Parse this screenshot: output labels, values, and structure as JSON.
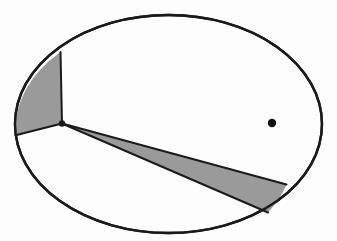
{
  "figure": {
    "type": "geometric-diagram",
    "canvas": {
      "width": 337,
      "height": 241,
      "background": "#fdfdfd"
    },
    "colors": {
      "outline": "#1a1a1a",
      "shade": "#9a9a9a",
      "interior": "#fdfdfd",
      "dot": "#111111"
    },
    "stroke": {
      "outline_width": 2.4,
      "chord_width": 2.0
    },
    "ellipse": {
      "label": "ellipse-boundary",
      "cx": 168.5,
      "cy": 124,
      "rx": 153.5,
      "ry": 109
    },
    "vertex_point": {
      "label": "apex-vertex",
      "x": 62,
      "y": 123.5
    },
    "marked_dot": {
      "label": "focus-dot",
      "x": 272,
      "y": 123,
      "r": 4.2
    },
    "regions": [
      {
        "name": "upper-left-shaded-sector",
        "fill": "#9a9a9a",
        "path": "M 62 123.5 L 60.5 52 A 153.5 109 0 0 0 15.6 135.2 Z"
      },
      {
        "name": "lower-right-shaded-wedge",
        "fill": "#9a9a9a",
        "path": "M 62 123.5 L 286.5 184.5 A 153.5 109 0 0 1 268 212.5 Z"
      }
    ],
    "chords": [
      {
        "name": "upper-radius-chord",
        "x1": 62,
        "y1": 123.5,
        "x2": 60.5,
        "y2": 52
      },
      {
        "name": "left-radius-chord",
        "x1": 62,
        "y1": 123.5,
        "x2": 15.6,
        "y2": 135.2
      },
      {
        "name": "wedge-upper-chord",
        "x1": 62,
        "y1": 123.5,
        "x2": 286.5,
        "y2": 184.5
      },
      {
        "name": "wedge-lower-chord",
        "x1": 62,
        "y1": 123.5,
        "x2": 268,
        "y2": 212.5
      }
    ]
  }
}
